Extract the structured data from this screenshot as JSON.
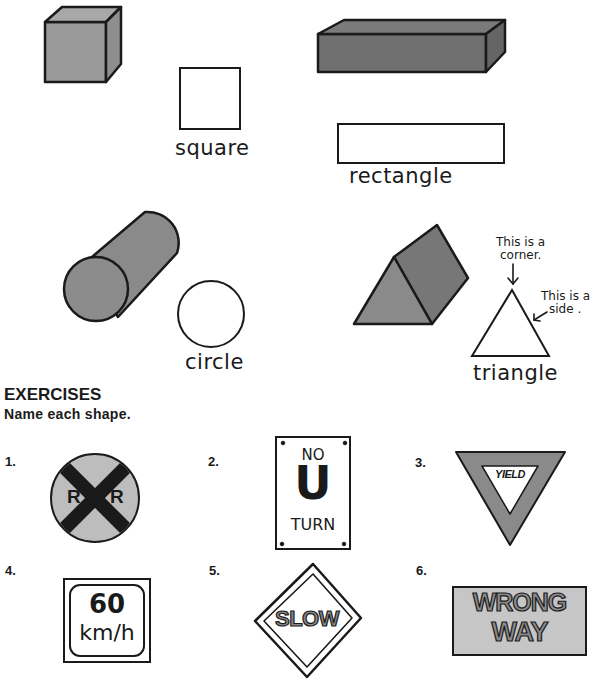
{
  "lesson": {
    "shapes": [
      {
        "solid": "cube",
        "flat_label": "square"
      },
      {
        "solid": "rectangular-prism",
        "flat_label": "rectangle"
      },
      {
        "solid": "cylinder",
        "flat_label": "circle"
      },
      {
        "solid": "triangular-prism",
        "flat_label": "triangle"
      }
    ],
    "annotations": {
      "corner_note_line1": "This is a",
      "corner_note_line2": "corner.",
      "side_note_line1": "This is a",
      "side_note_line2": "side ."
    }
  },
  "exercises": {
    "title": "EXERCISES",
    "instruction": "Name each shape.",
    "items": [
      {
        "number": "1.",
        "sign": "railroad-crossing",
        "text_left": "R",
        "text_right": "R"
      },
      {
        "number": "2.",
        "sign": "no-u-turn",
        "line1": "NO",
        "line2": "U",
        "line3": "TURN"
      },
      {
        "number": "3.",
        "sign": "yield",
        "text": "YIELD"
      },
      {
        "number": "4.",
        "sign": "speed-limit",
        "line1": "60",
        "line2": "km/h"
      },
      {
        "number": "5.",
        "sign": "slow",
        "text": "SLOW"
      },
      {
        "number": "6.",
        "sign": "wrong-way",
        "line1": "WRONG",
        "line2": "WAY"
      }
    ]
  },
  "colors": {
    "light_gray": "#a9a9a9",
    "mid_gray": "#8c8c8c",
    "dark_gray": "#6e6e6e",
    "sign_gray": "#c8c8c8",
    "outline": "#1a1a1a"
  }
}
